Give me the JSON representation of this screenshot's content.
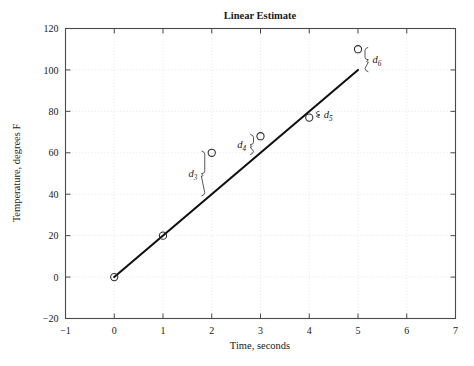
{
  "chart_data": {
    "type": "scatter",
    "title": "Linear Estimate",
    "xlabel": "Time, seconds",
    "ylabel": "Temperature, degrees F",
    "xlim": [
      -1,
      7
    ],
    "ylim": [
      -20,
      120
    ],
    "xticks": [
      -1,
      0,
      1,
      2,
      3,
      4,
      5,
      6,
      7
    ],
    "xticklabels": [
      "−1",
      "0",
      "1",
      "2",
      "3",
      "4",
      "5",
      "6",
      "7"
    ],
    "yticks": [
      -20,
      0,
      20,
      40,
      60,
      80,
      100,
      120
    ],
    "yticklabels": [
      "−20",
      "0",
      "20",
      "40",
      "60",
      "80",
      "100",
      "120"
    ],
    "grid": true,
    "legend": "none",
    "series": [
      {
        "name": "data points",
        "marker": "open-circle",
        "x": [
          0,
          1,
          2,
          3,
          4,
          5
        ],
        "y": [
          0,
          20,
          60,
          68,
          77,
          110
        ]
      },
      {
        "name": "linear fit",
        "type": "line",
        "x": [
          0,
          5
        ],
        "y": [
          0,
          100
        ],
        "slope": 20,
        "intercept": 0
      }
    ],
    "annotations": [
      {
        "label": "d",
        "subscript": "3",
        "x": 2,
        "y_top": 60,
        "y_bottom": 40,
        "side": "left"
      },
      {
        "label": "d",
        "subscript": "4",
        "x": 3,
        "y_top": 68,
        "y_bottom": 60,
        "side": "left"
      },
      {
        "label": "d",
        "subscript": "5",
        "x": 4,
        "y_top": 80,
        "y_bottom": 77,
        "side": "right"
      },
      {
        "label": "d",
        "subscript": "6",
        "x": 5,
        "y_top": 110,
        "y_bottom": 100,
        "side": "right"
      }
    ]
  },
  "figure": {
    "title": "Linear Estimate",
    "x_axis_title": "Time, seconds",
    "y_axis_title": "Temperature, degrees F",
    "x_tick_labels": [
      "−1",
      "0",
      "1",
      "2",
      "3",
      "4",
      "5",
      "6",
      "7"
    ],
    "y_tick_labels": [
      "120",
      "100",
      "80",
      "60",
      "40",
      "20",
      "0",
      "−20"
    ],
    "residual_labels": [
      "d",
      "d",
      "d",
      "d"
    ],
    "residual_subscripts": [
      "3",
      "4",
      "5",
      "6"
    ],
    "colors": {
      "line": "#111111",
      "marker": "#2b2b2b",
      "grid": "#d8d8d8",
      "frame": "#4a4a4a",
      "text": "#1a1a1a",
      "background": "#ffffff"
    }
  }
}
